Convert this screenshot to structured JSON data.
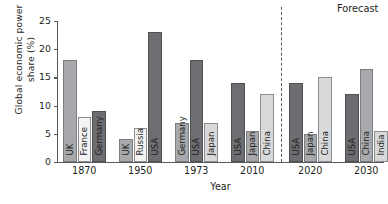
{
  "chart_data": {
    "type": "bar",
    "title": "",
    "xlabel": "Year",
    "ylabel": "Global economic power\nshare (%)",
    "ylim": [
      0,
      25
    ],
    "yticks": [
      0,
      5,
      10,
      15,
      20,
      25
    ],
    "grid": false,
    "legend": null,
    "categories": [
      "1870",
      "1950",
      "1973",
      "2010",
      "2020",
      "2030"
    ],
    "groups": [
      {
        "category": "1870",
        "bars": [
          {
            "label": "UK",
            "value": 18.0,
            "shade": "shade-mid"
          },
          {
            "label": "France",
            "value": 8.0,
            "shade": "shade-pale"
          },
          {
            "label": "Germany",
            "value": 9.0,
            "shade": "shade-dark"
          }
        ]
      },
      {
        "category": "1950",
        "bars": [
          {
            "label": "UK",
            "value": 4.0,
            "shade": "shade-mid"
          },
          {
            "label": "Russia",
            "value": 6.0,
            "shade": "shade-pale"
          },
          {
            "label": "USA",
            "value": 23.0,
            "shade": "shade-dark"
          }
        ]
      },
      {
        "category": "1973",
        "bars": [
          {
            "label": "Germany",
            "value": 7.0,
            "shade": "shade-mid"
          },
          {
            "label": "USA",
            "value": 18.0,
            "shade": "shade-dark"
          },
          {
            "label": "Japan",
            "value": 7.0,
            "shade": "shade-light"
          }
        ]
      },
      {
        "category": "2010",
        "bars": [
          {
            "label": "USA",
            "value": 14.0,
            "shade": "shade-dark"
          },
          {
            "label": "Japan",
            "value": 5.5,
            "shade": "shade-mid"
          },
          {
            "label": "China",
            "value": 12.0,
            "shade": "shade-light"
          }
        ]
      },
      {
        "category": "2020",
        "bars": [
          {
            "label": "USA",
            "value": 14.0,
            "shade": "shade-dark"
          },
          {
            "label": "Japan",
            "value": 5.0,
            "shade": "shade-mid"
          },
          {
            "label": "China",
            "value": 15.0,
            "shade": "shade-light"
          }
        ]
      },
      {
        "category": "2030",
        "bars": [
          {
            "label": "USA",
            "value": 12.0,
            "shade": "shade-dark"
          },
          {
            "label": "China",
            "value": 16.5,
            "shade": "shade-mid"
          },
          {
            "label": "India",
            "value": 5.5,
            "shade": "shade-light"
          }
        ]
      }
    ],
    "annotations": [
      {
        "name": "forecast-label",
        "text": "Forecast",
        "at_category": "2030"
      }
    ],
    "divider": {
      "after_category": "2010",
      "style": "dashed"
    }
  }
}
